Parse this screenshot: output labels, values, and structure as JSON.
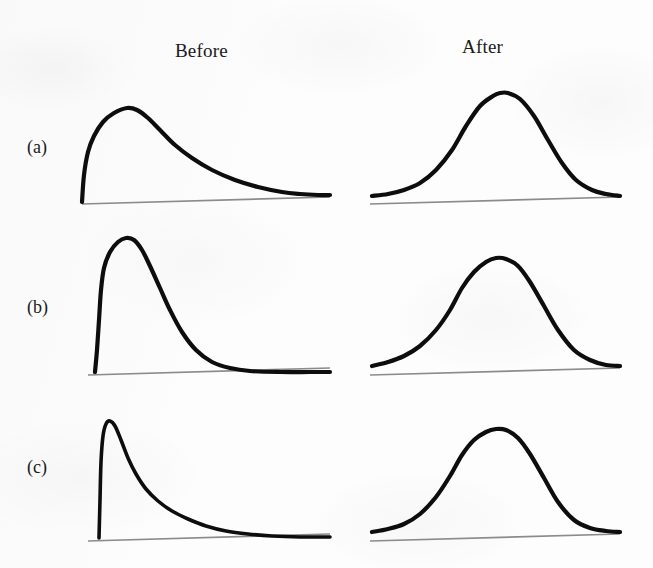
{
  "figure": {
    "background_color": "#fdfdfd",
    "curve_color": "#0d0d0d",
    "axis_color": "#8b8b8b"
  },
  "headers": {
    "before": "Before",
    "after": "After"
  },
  "row_labels": {
    "a": "(a)",
    "b": "(b)",
    "c": "(c)"
  },
  "chart_data": {
    "type": "line",
    "title": "",
    "subtitle": "",
    "xlabel": "",
    "ylabel": "",
    "grid": false,
    "legend": "none",
    "axes_shown": [
      "x"
    ],
    "panel_layout": {
      "rows": 3,
      "cols": 2,
      "row_labels": [
        "(a)",
        "(b)",
        "(c)"
      ],
      "col_labels": [
        "Before",
        "After"
      ]
    },
    "panels": [
      {
        "row": "(a)",
        "column": "Before",
        "shape": "right-skewed",
        "skewness": "moderate",
        "peak_x_fraction": 0.22,
        "peak_y_fraction": 1.0,
        "x_range": [
          82,
          330
        ],
        "baseline_y": 202,
        "points": [
          [
            82,
            202
          ],
          [
            84,
            175
          ],
          [
            88,
            152
          ],
          [
            94,
            136
          ],
          [
            103,
            122
          ],
          [
            114,
            113
          ],
          [
            127,
            108
          ],
          [
            137,
            110
          ],
          [
            148,
            118
          ],
          [
            160,
            130
          ],
          [
            175,
            145
          ],
          [
            192,
            158
          ],
          [
            212,
            170
          ],
          [
            235,
            180
          ],
          [
            258,
            187
          ],
          [
            282,
            192
          ],
          [
            300,
            194
          ],
          [
            318,
            195
          ],
          [
            330,
            195
          ]
        ]
      },
      {
        "row": "(a)",
        "column": "After",
        "shape": "symmetric-bell",
        "skewness": "none",
        "peak_x_fraction": 0.5,
        "peak_y_fraction": 1.0,
        "x_range": [
          372,
          620
        ],
        "baseline_y": 202,
        "points": [
          [
            372,
            196
          ],
          [
            388,
            194
          ],
          [
            404,
            190
          ],
          [
            420,
            183
          ],
          [
            436,
            170
          ],
          [
            452,
            150
          ],
          [
            466,
            126
          ],
          [
            480,
            106
          ],
          [
            493,
            96
          ],
          [
            500,
            93
          ],
          [
            508,
            93
          ],
          [
            520,
            99
          ],
          [
            534,
            116
          ],
          [
            548,
            140
          ],
          [
            562,
            163
          ],
          [
            576,
            180
          ],
          [
            592,
            190
          ],
          [
            606,
            194
          ],
          [
            620,
            196
          ]
        ]
      },
      {
        "row": "(b)",
        "column": "Before",
        "shape": "right-skewed",
        "skewness": "strong",
        "peak_x_fraction": 0.14,
        "peak_y_fraction": 1.0,
        "x_range": [
          95,
          330
        ],
        "baseline_y": 372,
        "points": [
          [
            95,
            372
          ],
          [
            97,
            350
          ],
          [
            99,
            320
          ],
          [
            101,
            290
          ],
          [
            104,
            268
          ],
          [
            110,
            252
          ],
          [
            118,
            242
          ],
          [
            126,
            238
          ],
          [
            134,
            240
          ],
          [
            142,
            250
          ],
          [
            150,
            266
          ],
          [
            160,
            288
          ],
          [
            170,
            310
          ],
          [
            182,
            332
          ],
          [
            196,
            350
          ],
          [
            212,
            362
          ],
          [
            230,
            368
          ],
          [
            250,
            371
          ],
          [
            280,
            372
          ],
          [
            310,
            372
          ],
          [
            330,
            372
          ]
        ]
      },
      {
        "row": "(b)",
        "column": "After",
        "shape": "symmetric-bell",
        "skewness": "none",
        "peak_x_fraction": 0.5,
        "peak_y_fraction": 1.0,
        "x_range": [
          372,
          620
        ],
        "baseline_y": 372,
        "points": [
          [
            372,
            366
          ],
          [
            388,
            362
          ],
          [
            404,
            356
          ],
          [
            420,
            346
          ],
          [
            436,
            330
          ],
          [
            450,
            310
          ],
          [
            462,
            288
          ],
          [
            474,
            272
          ],
          [
            486,
            262
          ],
          [
            496,
            258
          ],
          [
            506,
            259
          ],
          [
            518,
            266
          ],
          [
            530,
            282
          ],
          [
            544,
            306
          ],
          [
            558,
            330
          ],
          [
            574,
            350
          ],
          [
            590,
            360
          ],
          [
            606,
            365
          ],
          [
            620,
            366
          ]
        ]
      },
      {
        "row": "(c)",
        "column": "Before",
        "shape": "right-skewed",
        "skewness": "severe",
        "peak_x_fraction": 0.06,
        "peak_y_fraction": 1.0,
        "x_range": [
          99,
          330
        ],
        "baseline_y": 538,
        "points": [
          [
            99,
            538
          ],
          [
            100,
            500
          ],
          [
            101,
            462
          ],
          [
            103,
            436
          ],
          [
            106,
            424
          ],
          [
            110,
            421
          ],
          [
            115,
            426
          ],
          [
            121,
            440
          ],
          [
            128,
            458
          ],
          [
            136,
            474
          ],
          [
            146,
            489
          ],
          [
            158,
            501
          ],
          [
            172,
            511
          ],
          [
            188,
            519
          ],
          [
            206,
            526
          ],
          [
            226,
            531
          ],
          [
            248,
            534
          ],
          [
            272,
            536
          ],
          [
            300,
            537
          ],
          [
            330,
            537
          ]
        ]
      },
      {
        "row": "(c)",
        "column": "After",
        "shape": "symmetric-bell",
        "skewness": "none",
        "peak_x_fraction": 0.5,
        "peak_y_fraction": 1.0,
        "x_range": [
          372,
          620
        ],
        "baseline_y": 538,
        "points": [
          [
            372,
            532
          ],
          [
            388,
            529
          ],
          [
            404,
            524
          ],
          [
            420,
            514
          ],
          [
            436,
            497
          ],
          [
            450,
            476
          ],
          [
            462,
            455
          ],
          [
            474,
            440
          ],
          [
            486,
            432
          ],
          [
            496,
            429
          ],
          [
            506,
            430
          ],
          [
            518,
            438
          ],
          [
            530,
            454
          ],
          [
            544,
            478
          ],
          [
            558,
            502
          ],
          [
            574,
            520
          ],
          [
            590,
            528
          ],
          [
            606,
            531
          ],
          [
            620,
            532
          ]
        ]
      }
    ],
    "baselines": [
      {
        "row": "(a)",
        "column": "Before",
        "x1": 82,
        "y1": 204,
        "x2": 330,
        "y2": 197
      },
      {
        "row": "(a)",
        "column": "After",
        "x1": 370,
        "y1": 204,
        "x2": 620,
        "y2": 197
      },
      {
        "row": "(b)",
        "column": "Before",
        "x1": 88,
        "y1": 375,
        "x2": 330,
        "y2": 368
      },
      {
        "row": "(b)",
        "column": "After",
        "x1": 370,
        "y1": 375,
        "x2": 620,
        "y2": 368
      },
      {
        "row": "(c)",
        "column": "Before",
        "x1": 88,
        "y1": 541,
        "x2": 330,
        "y2": 534
      },
      {
        "row": "(c)",
        "column": "After",
        "x1": 370,
        "y1": 541,
        "x2": 620,
        "y2": 534
      }
    ]
  }
}
